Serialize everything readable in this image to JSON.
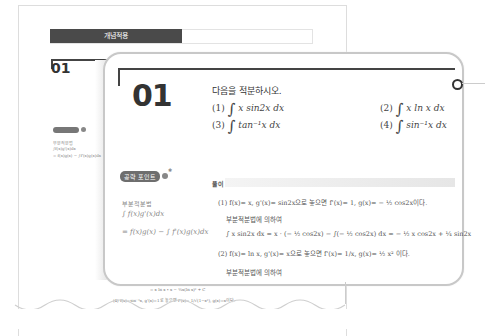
{
  "background_page": {
    "header_label": "개념적용",
    "number": "01",
    "tip_badge": "공략 포인트",
    "tip_lines": [
      "부분적분법",
      "∫f(x)g'(x)dx",
      "= f(x)g(x) − ∫f'(x)g(x)dx"
    ],
    "below_lines": [
      "= x ln x ∙ x − ½x(ln x)² + C",
      "(4) f(x)=sin⁻¹x, g'(x)=1로 놓으면 f'(x)= 1/√(1−x²), g(x)=x이다."
    ]
  },
  "card": {
    "number": "01",
    "prompt": "다음을 적분하시오.",
    "problems": [
      {
        "label": "(1)",
        "expr": "x sin2x dx"
      },
      {
        "label": "(2)",
        "expr": "x ln x dx"
      },
      {
        "label": "(3)",
        "expr": "tan⁻¹x dx"
      },
      {
        "label": "(4)",
        "expr": "sin⁻¹x dx"
      }
    ],
    "tip": {
      "badge": "공략 포인트",
      "title": "부분적분법",
      "line1": "∫ f(x)g'(x)dx",
      "line2": "= f(x)g(x) − ∫ f'(x)g(x)dx"
    },
    "solution": {
      "label": "풀이",
      "lines": [
        "(1) f(x)= x,  g'(x)= sin2x으로 놓으면  f'(x)= 1,  g(x)= − ½ cos2x이다.",
        "부분적분법에 의하여",
        "∫ x sin2x dx = x · (− ½ cos2x) − ∫(− ½ cos2x) dx  = − ½ x cos2x + ¼ sin2x",
        "(2) f(x)= ln x,  g'(x)= x으로 놓으면  f'(x)= 1/x,  g(x)= ½ x² 이다.",
        "부분적분법에 의하여"
      ]
    }
  }
}
